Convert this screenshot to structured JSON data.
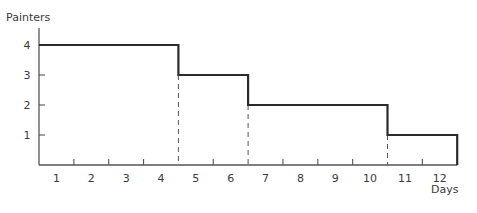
{
  "chart_data": {
    "type": "line",
    "subtype": "step",
    "title": "",
    "xlabel": "Days",
    "ylabel": "Painters",
    "categories": [
      "1",
      "2",
      "3",
      "4",
      "5",
      "6",
      "7",
      "8",
      "9",
      "10",
      "11",
      "12"
    ],
    "x": [
      1,
      2,
      3,
      4,
      5,
      6,
      7,
      8,
      9,
      10,
      11,
      12
    ],
    "series": [
      {
        "name": "Painters",
        "values": [
          4,
          4,
          4,
          4,
          3,
          3,
          2,
          2,
          2,
          2,
          1,
          1
        ]
      }
    ],
    "steps": [
      {
        "from_day": 1,
        "to_day": 4,
        "painters": 4
      },
      {
        "from_day": 5,
        "to_day": 6,
        "painters": 3
      },
      {
        "from_day": 7,
        "to_day": 10,
        "painters": 2
      },
      {
        "from_day": 11,
        "to_day": 12,
        "painters": 1
      }
    ],
    "y_ticks": [
      "1",
      "2",
      "3",
      "4"
    ],
    "ylim": [
      0,
      4
    ],
    "xlim": [
      0,
      12
    ],
    "grid": false,
    "legend": "none",
    "annotations": [
      "dashed vertical drop lines at step changes (after day 4, day 6, day 10)"
    ]
  },
  "colors": {
    "line": "#2b2b2b",
    "axis": "#555555",
    "text": "#3a3a3a"
  }
}
